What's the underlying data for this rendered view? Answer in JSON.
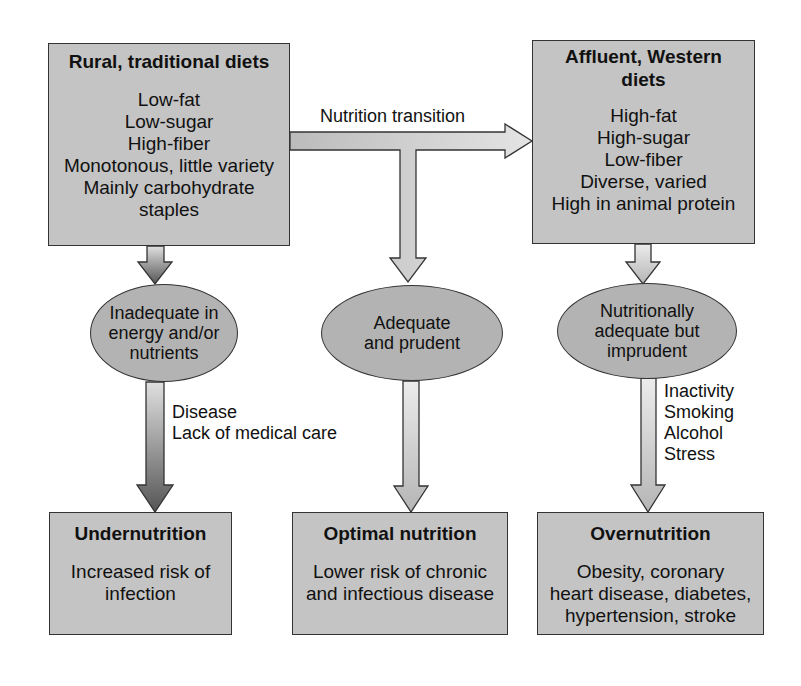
{
  "diagram": {
    "top_left": {
      "title": "Rural, traditional diets",
      "items": [
        "Low-fat",
        "Low-sugar",
        "High-fiber",
        "Monotonous, little variety",
        "Mainly carbohydrate",
        "staples"
      ]
    },
    "top_right": {
      "title_line1": "Affluent, Western",
      "title_line2": "diets",
      "items": [
        "High-fat",
        "High-sugar",
        "Low-fiber",
        "Diverse, varied",
        "High in animal protein"
      ]
    },
    "transition_label": "Nutrition transition",
    "ellipses": {
      "left": [
        "Inadequate in",
        "energy and/or",
        "nutrients"
      ],
      "middle": [
        "Adequate",
        "and prudent"
      ],
      "right": [
        "Nutritionally",
        "adequate but",
        "imprudent"
      ]
    },
    "left_factors": [
      "Disease",
      "Lack of medical care"
    ],
    "right_factors": [
      "Inactivity",
      "Smoking",
      "Alcohol",
      "Stress"
    ],
    "bottom": {
      "left": {
        "title": "Undernutrition",
        "items": [
          "Increased risk of",
          "infection"
        ]
      },
      "middle": {
        "title": "Optimal nutrition",
        "items": [
          "Lower risk of chronic",
          "and infectious disease"
        ]
      },
      "right": {
        "title": "Overnutrition",
        "items": [
          "Obesity, coronary",
          "heart disease, diabetes,",
          "hypertension, stroke"
        ]
      }
    },
    "colors": {
      "box_fill": "#c4c4c4",
      "ellipse_fill": "#b3b3b3",
      "arrow_light": "#d8d8d8",
      "arrow_dark": "#555555",
      "stroke": "#333333"
    }
  }
}
